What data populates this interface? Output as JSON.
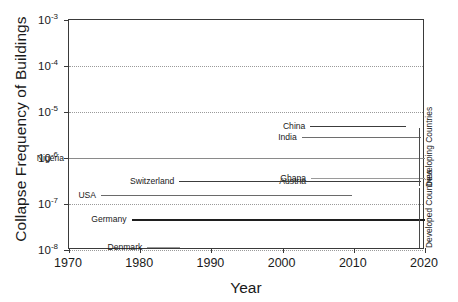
{
  "chart_data": {
    "type": "line",
    "title": "",
    "xlabel": "Year",
    "ylabel": "Collapse Frequency of Buildings",
    "xlim": [
      1970,
      2020
    ],
    "ylim": [
      1e-08,
      0.001
    ],
    "yscale": "log",
    "grid": true,
    "legend": "none",
    "xticks": [
      "1970",
      "1980",
      "1990",
      "2000",
      "2010",
      "2020"
    ],
    "xtick_values": [
      1970,
      1980,
      1990,
      2000,
      2010,
      2020
    ],
    "yticks": [
      "10-3",
      "10-4",
      "10-5",
      "10-6",
      "10-7",
      "10-8"
    ],
    "ytick_values": [
      0.001,
      0.0001,
      1e-05,
      1e-06,
      1e-07,
      1e-08
    ],
    "ytick_mantissa": "10",
    "ytick_exponents": [
      "-3",
      "-4",
      "-5",
      "-6",
      "-7",
      "-8"
    ],
    "series": [
      {
        "name": "China",
        "label": "China",
        "x_start": 2003.9,
        "x_end": 2017.3,
        "value": 5e-06,
        "color": "#3c3c3c",
        "linewidth": 1.7,
        "group": "Developing Countries"
      },
      {
        "name": "India",
        "label": "India",
        "x_start": 2002.7,
        "x_end": 2019.4,
        "value": 2.9e-06,
        "color": "#6e6e6e",
        "linewidth": 1.3,
        "group": "Developing Countries"
      },
      {
        "name": "Nigeria",
        "label": "Nigeria",
        "x_start": 1970.0,
        "x_end": 2020.0,
        "value": 1e-06,
        "color": "#8a8a8a",
        "linewidth": 1.0,
        "group": "Developing Countries"
      },
      {
        "name": "Ghana",
        "label": "Ghana",
        "x_start": 2004.0,
        "x_end": 2020.0,
        "value": 3.6e-07,
        "color": "#9a9a9a",
        "linewidth": 1.6,
        "group": "Developing Countries"
      },
      {
        "name": "Austria",
        "label": "Austria",
        "x_start": 2004.0,
        "x_end": 2019.5,
        "value": 3.1e-07,
        "color": "#5a5a5a",
        "linewidth": 1.2,
        "group": "Developed Countries"
      },
      {
        "name": "Switzerland",
        "label": "Switzerland",
        "x_start": 1985.5,
        "x_end": 2019.5,
        "value": 3.1e-07,
        "color": "#3c3c3c",
        "linewidth": 1.2,
        "group": "Developed Countries"
      },
      {
        "name": "USA",
        "label": "USA",
        "x_start": 1974.5,
        "x_end": 2009.7,
        "value": 1.6e-07,
        "color": "#6a6a6a",
        "linewidth": 1.3,
        "group": "Developed Countries"
      },
      {
        "name": "Germany",
        "label": "Germany",
        "x_start": 1978.8,
        "x_end": 2020.0,
        "value": 4.8e-08,
        "color": "#1f1f1f",
        "linewidth": 2.6,
        "group": "Developed Countries"
      },
      {
        "name": "Denmark",
        "label": "Denmark",
        "x_start": 1981.0,
        "x_end": 1985.6,
        "value": 1.15e-08,
        "color": "#9a9a9a",
        "linewidth": 1.2,
        "group": "Developed Countries"
      }
    ],
    "annotations": [
      {
        "name": "developing-countries",
        "text": "Developing Countries",
        "orientation": "vertical",
        "y_top": 4.6e-06,
        "y_bottom": 2.4e-07
      },
      {
        "name": "developed-countries",
        "text": "Developed Countries",
        "orientation": "vertical",
        "y_top": 2.2e-07,
        "y_bottom": 1.1e-08
      }
    ]
  },
  "axis": {
    "ylabel": "Collapse Frequency of Buildings",
    "xlabel": "Year"
  }
}
